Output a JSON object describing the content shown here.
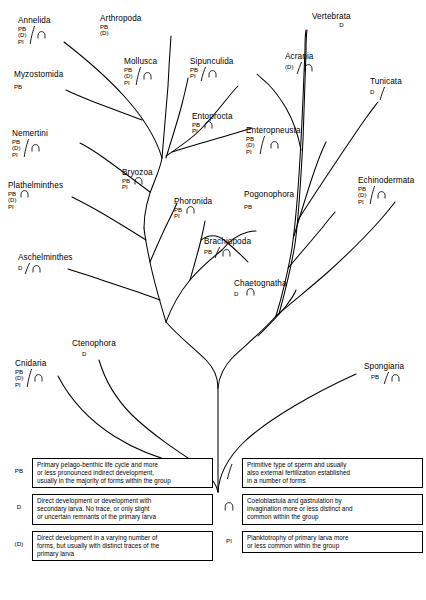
{
  "diagram": {
    "type": "phylogenetic-tree"
  },
  "taxa": [
    {
      "name": "Annelida",
      "codes": [
        "PB",
        "(D)",
        "PI"
      ],
      "sperm": true,
      "arch": true,
      "x": 18,
      "y": 16
    },
    {
      "name": "Arthropoda",
      "codes": [
        "PB",
        "(D)"
      ],
      "sperm": false,
      "arch": false,
      "x": 100,
      "y": 14
    },
    {
      "name": "Myzostomida",
      "codes": [
        "PB"
      ],
      "sperm": false,
      "arch": false,
      "x": 14,
      "y": 70
    },
    {
      "name": "Mollusca",
      "codes": [
        "PB",
        "(D)",
        "PI"
      ],
      "sperm": true,
      "arch": true,
      "x": 124,
      "y": 57
    },
    {
      "name": "Sipunculida",
      "codes": [
        "PB",
        "PI"
      ],
      "sperm": true,
      "arch": true,
      "x": 190,
      "y": 57
    },
    {
      "name": "Entoprocta",
      "codes": [
        "PB",
        "PI"
      ],
      "sperm": false,
      "arch": true,
      "x": 192,
      "y": 112
    },
    {
      "name": "Nemertini",
      "codes": [
        "PB",
        "(D)",
        "PI"
      ],
      "sperm": true,
      "arch": true,
      "x": 12,
      "y": 129
    },
    {
      "name": "Plathelminthes",
      "codes": [
        "PB",
        "(D)",
        "PI"
      ],
      "sperm": false,
      "arch": true,
      "x": 8,
      "y": 181
    },
    {
      "name": "Bryozoa",
      "codes": [
        "PB",
        "PI"
      ],
      "sperm": false,
      "arch": true,
      "x": 122,
      "y": 168
    },
    {
      "name": "Phoronida",
      "codes": [
        "PB",
        "PI"
      ],
      "sperm": false,
      "arch": true,
      "x": 174,
      "y": 197
    },
    {
      "name": "Brachiopoda",
      "codes": [
        "PB"
      ],
      "sperm": true,
      "arch": true,
      "x": 204,
      "y": 237
    },
    {
      "name": "Aschelminthes",
      "codes": [
        "D"
      ],
      "sperm": true,
      "arch": true,
      "x": 18,
      "y": 253
    },
    {
      "name": "Chaetognatha",
      "codes": [
        "D"
      ],
      "sperm": false,
      "arch": true,
      "x": 234,
      "y": 279
    },
    {
      "name": "Pogonophora",
      "codes": [
        "PB"
      ],
      "sperm": false,
      "arch": false,
      "x": 244,
      "y": 190
    },
    {
      "name": "Enteropneusta",
      "codes": [
        "PB",
        "(D)",
        "PI"
      ],
      "sperm": true,
      "arch": true,
      "x": 246,
      "y": 126
    },
    {
      "name": "Echinodermata",
      "codes": [
        "PB",
        "(D)",
        "PI"
      ],
      "sperm": true,
      "arch": true,
      "x": 358,
      "y": 176
    },
    {
      "name": "Acrania",
      "codes": [
        "(D)"
      ],
      "sperm": true,
      "arch": true,
      "x": 285,
      "y": 52
    },
    {
      "name": "Vertebrata",
      "codes": [
        "D"
      ],
      "sperm": false,
      "arch": false,
      "x": 312,
      "y": 12
    },
    {
      "name": "Tunicata",
      "codes": [
        "D"
      ],
      "sperm": true,
      "arch": false,
      "x": 370,
      "y": 77
    },
    {
      "name": "Ctenophora",
      "codes": [
        "D"
      ],
      "sperm": false,
      "arch": false,
      "x": 72,
      "y": 339
    },
    {
      "name": "Cnidaria",
      "codes": [
        "PB",
        "(D)",
        "PI"
      ],
      "sperm": true,
      "arch": true,
      "x": 15,
      "y": 359
    },
    {
      "name": "Spongiaria",
      "codes": [
        "PB"
      ],
      "sperm": true,
      "arch": true,
      "x": 364,
      "y": 362
    }
  ],
  "legend": {
    "left": [
      {
        "key": "PB",
        "key_symbol": "text",
        "lines": [
          "Primary pelago-benthic life cycle and more",
          "or less pronounced indirect development,",
          "usually in the majority of forms within the group"
        ]
      },
      {
        "key": "D",
        "key_symbol": "text",
        "lines": [
          "Direct development or development with",
          "secondary larva. No trace, or only slight",
          "or uncertain remnants of the primary larva"
        ]
      },
      {
        "key": "(D)",
        "key_symbol": "text",
        "lines": [
          "Direct development in a varying number of",
          "forms, but usually with distinct traces of the",
          "primary larva"
        ]
      }
    ],
    "right": [
      {
        "key": "",
        "key_symbol": "sperm-icon",
        "lines": [
          "Primitive  type  of sperm  and  usually",
          "also  external  fertilization  established",
          "in  a  number  of  forms"
        ]
      },
      {
        "key": "",
        "key_symbol": "coeloblastula-arch-icon",
        "lines": [
          "Coeloblastula  and  gastrulation  by",
          "invagination  more  or  less  distinct  and",
          "common  within  the  group"
        ]
      },
      {
        "key": "PI",
        "key_symbol": "text",
        "lines": [
          "Planktotrophy of primary larva more",
          "or less common within the group"
        ]
      }
    ]
  },
  "colors": {
    "ink": "#000000",
    "background": "#ffffff"
  }
}
